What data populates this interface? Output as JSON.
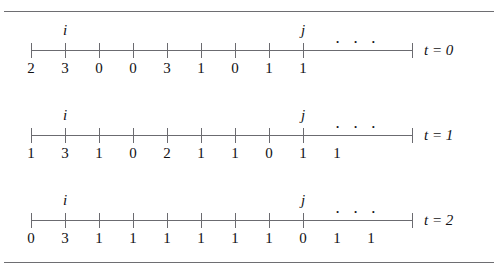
{
  "figure": {
    "type": "number-line-sequence",
    "ellipsis": "· · ·",
    "pointer_i": "i",
    "pointer_j": "j",
    "rows": [
      {
        "caption": "t = 0",
        "values": [
          "2",
          "3",
          "0",
          "0",
          "3",
          "1",
          "0",
          "1",
          "1"
        ],
        "pointer_i_index": 1,
        "pointer_j_index": 8,
        "tick_count": 9
      },
      {
        "caption": "t = 1",
        "values": [
          "1",
          "3",
          "1",
          "0",
          "2",
          "1",
          "1",
          "0",
          "1",
          "1"
        ],
        "pointer_i_index": 1,
        "pointer_j_index": 8,
        "tick_count": 9
      },
      {
        "caption": "t = 2",
        "values": [
          "0",
          "3",
          "1",
          "1",
          "1",
          "1",
          "1",
          "1",
          "0",
          "1",
          "1"
        ],
        "pointer_i_index": 1,
        "pointer_j_index": 8,
        "tick_count": 9
      }
    ],
    "geometry": {
      "axis_left": 31,
      "tick_step": 34,
      "axis_right": 412
    },
    "colors": {
      "ink": "#111114",
      "line": "#6b6b70",
      "rule": "#6e6e72",
      "background": "#ffffff"
    }
  }
}
